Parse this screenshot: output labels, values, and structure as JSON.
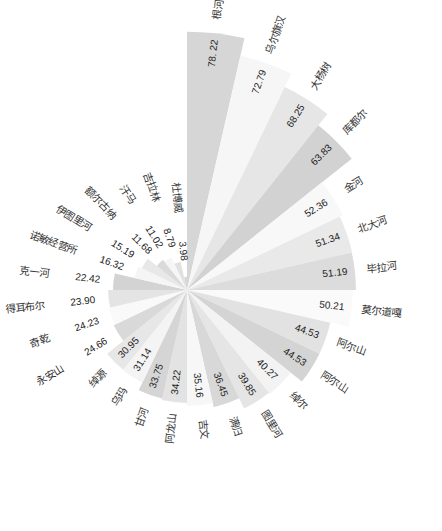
{
  "chart_data": {
    "type": "rose",
    "title": "",
    "categories": [
      "根河",
      "乌尔旗汉",
      "大杨树",
      "库都尔",
      "金河",
      "北大河",
      "毕拉河",
      "莫尔道嘎",
      "阿尔山",
      "阿尔山",
      "绰尔",
      "图里河",
      "满归",
      "吉文",
      "阿龙山",
      "甘河",
      "乌玛",
      "绰源",
      "永安山",
      "奇乾",
      "得耳布尔",
      "克一河",
      "诺敏经营所",
      "伊图里河",
      "额尔古纳",
      "汗马",
      "吉拉林",
      "杜博威"
    ],
    "values": [
      78.22,
      72.79,
      68.25,
      63.83,
      52.36,
      51.34,
      51.19,
      50.21,
      44.53,
      44.53,
      40.27,
      39.85,
      36.45,
      35.16,
      34.22,
      33.75,
      31.14,
      30.95,
      24.66,
      24.23,
      23.9,
      22.42,
      16.32,
      15.19,
      11.68,
      11.02,
      8.79,
      3.98
    ],
    "value_labels": [
      "78. 22",
      "72.79",
      "68.25",
      "63.83",
      "52.36",
      "51.34",
      "51.19",
      "50.21",
      "44.53",
      "44.53",
      "40.27",
      "39.85",
      "36.45",
      "35.16",
      "34.22",
      "33.75",
      "31.14",
      "30.95",
      "24.66",
      "24.23",
      "23.90",
      "22.42",
      "16.32",
      "15.19",
      "11.68",
      "11.02",
      "8.79",
      "3.98"
    ],
    "colors": [
      "#d6d6d6",
      "#f6f6f6",
      "#e6e6e6",
      "#d2d2d2",
      "#f8f8f8",
      "#e9e9e9",
      "#dcdcdc",
      "#fafafa",
      "#e2e2e2",
      "#d4d4d4",
      "#f3f3f3",
      "#e5e5e5",
      "#d8d8d8",
      "#f7f7f7",
      "#e3e3e3",
      "#d5d5d5",
      "#f4f4f4",
      "#e7e7e7",
      "#d9d9d9",
      "#f9f9f9",
      "#e4e4e4",
      "#d3d3d3",
      "#f5f5f5",
      "#e8e8e8",
      "#dadada",
      "#f6f6f6",
      "#e1e1e1",
      "#d7d7d7"
    ],
    "start_angle_deg": 0,
    "direction": "clockwise",
    "grid": false,
    "legend": "none"
  },
  "layout": {
    "cx": 187,
    "cy": 290,
    "px_per_unit": 3.3
  }
}
